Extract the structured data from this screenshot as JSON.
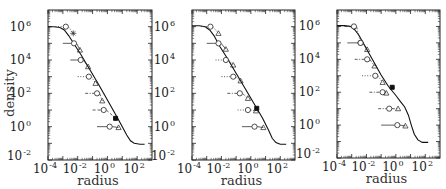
{
  "chart_data": [
    {
      "type": "line",
      "title": "",
      "xlabel": "radius",
      "ylabel": "density",
      "xscale": "log",
      "yscale": "log",
      "xlim": [
        0.0001,
        1000
      ],
      "ylim": [
        0.01,
        10000000
      ],
      "xticks": [
        {
          "base": "10",
          "exp": "-4",
          "value": -4
        },
        {
          "base": "10",
          "exp": "-2",
          "value": -2
        },
        {
          "base": "10",
          "exp": "0",
          "value": 0
        },
        {
          "base": "10",
          "exp": "2",
          "value": 2
        }
      ],
      "yticks": [
        {
          "base": "10",
          "exp": "-2",
          "value": -2
        },
        {
          "base": "10",
          "exp": "0",
          "value": 0
        },
        {
          "base": "10",
          "exp": "2",
          "value": 2
        },
        {
          "base": "10",
          "exp": "4",
          "value": 4
        },
        {
          "base": "10",
          "exp": "6",
          "value": 6
        }
      ],
      "show_ylabel": true,
      "profile_log": [
        [
          -4.0,
          6.0
        ],
        [
          -3.6,
          6.0
        ],
        [
          -3.2,
          5.95
        ],
        [
          -2.9,
          5.8
        ],
        [
          -2.6,
          5.45
        ],
        [
          -2.2,
          4.9
        ],
        [
          -1.8,
          4.35
        ],
        [
          -1.2,
          3.45
        ],
        [
          -0.6,
          2.55
        ],
        [
          0.0,
          1.6
        ],
        [
          0.6,
          0.65
        ],
        [
          1.0,
          0.0
        ],
        [
          1.3,
          -0.5
        ],
        [
          1.55,
          -0.85
        ],
        [
          1.8,
          -1.0
        ],
        [
          2.2,
          -1.05
        ],
        [
          2.5,
          -1.05
        ]
      ],
      "series": [
        {
          "name": "level 1",
          "style": "dotted",
          "line_from": -3.5,
          "circle": [
            -2.8,
            6.0
          ],
          "marker2": {
            "shape": "star",
            "at": [
              -2.3,
              5.6
            ]
          }
        },
        {
          "name": "level 2",
          "style": "solid",
          "line_from": -3.0,
          "circle": [
            -2.25,
            5.0
          ],
          "marker2": {
            "shape": "triangle",
            "at": [
              -1.85,
              4.6
            ]
          }
        },
        {
          "name": "level 3",
          "style": "solid",
          "line_from": -2.5,
          "circle": [
            -1.8,
            4.0
          ],
          "marker2": {
            "shape": "triangle",
            "at": [
              -1.3,
              3.6
            ]
          }
        },
        {
          "name": "level 4",
          "style": "dotted",
          "line_from": -2.0,
          "circle": [
            -1.25,
            3.0
          ],
          "marker2": {
            "shape": "triangle",
            "at": [
              -0.8,
              2.6
            ]
          }
        },
        {
          "name": "level 5",
          "style": "dashdot",
          "line_from": -1.5,
          "circle": [
            -0.7,
            2.0
          ],
          "marker2": {
            "shape": "triangle",
            "at": [
              -0.35,
              1.55
            ]
          }
        },
        {
          "name": "level 6",
          "style": "dashed",
          "line_from": -1.0,
          "circle": [
            -0.25,
            1.0
          ],
          "marker2": {
            "shape": "filled",
            "at": [
              0.55,
              0.5
            ]
          }
        },
        {
          "name": "level 7",
          "style": "solid",
          "line_from": -0.7,
          "circle": [
            0.15,
            0.0
          ],
          "marker2": {
            "shape": "triangle",
            "at": [
              0.75,
              -0.05
            ]
          }
        }
      ]
    },
    {
      "type": "line",
      "title": "",
      "xlabel": "radius",
      "ylabel": "",
      "xscale": "log",
      "yscale": "log",
      "xlim": [
        0.0001,
        1000
      ],
      "ylim": [
        0.01,
        10000000
      ],
      "xticks": [
        {
          "base": "10",
          "exp": "-4",
          "value": -4
        },
        {
          "base": "10",
          "exp": "-2",
          "value": -2
        },
        {
          "base": "10",
          "exp": "0",
          "value": 0
        },
        {
          "base": "10",
          "exp": "2",
          "value": 2
        }
      ],
      "yticks": [
        {
          "base": "10",
          "exp": "-2",
          "value": -2
        },
        {
          "base": "10",
          "exp": "0",
          "value": 0
        },
        {
          "base": "10",
          "exp": "2",
          "value": 2
        },
        {
          "base": "10",
          "exp": "4",
          "value": 4
        },
        {
          "base": "10",
          "exp": "6",
          "value": 6
        }
      ],
      "show_ylabel": false,
      "profile_log": [
        [
          -4.0,
          6.05
        ],
        [
          -3.5,
          6.05
        ],
        [
          -3.1,
          6.0
        ],
        [
          -2.8,
          5.8
        ],
        [
          -2.5,
          5.45
        ],
        [
          -2.1,
          4.8
        ],
        [
          -1.6,
          4.1
        ],
        [
          -1.0,
          3.2
        ],
        [
          -0.4,
          2.3
        ],
        [
          0.2,
          1.4
        ],
        [
          0.8,
          0.5
        ],
        [
          1.2,
          -0.2
        ],
        [
          1.45,
          -0.7
        ],
        [
          1.7,
          -0.95
        ],
        [
          2.0,
          -1.05
        ],
        [
          2.4,
          -1.05
        ]
      ],
      "series": [
        {
          "name": "level 1",
          "style": "dotted",
          "line_from": -3.4,
          "circle": [
            -2.75,
            6.0
          ],
          "marker2": {
            "shape": "triangle",
            "at": [
              -2.2,
              5.6
            ]
          }
        },
        {
          "name": "level 2",
          "style": "solid",
          "line_from": -3.0,
          "circle": [
            -2.2,
            5.0
          ],
          "marker2": {
            "shape": "triangle",
            "at": [
              -1.7,
              4.65
            ]
          }
        },
        {
          "name": "level 3",
          "style": "dotted",
          "line_from": -2.4,
          "circle": [
            -1.7,
            4.0
          ],
          "marker2": {
            "shape": "triangle",
            "at": [
              -1.2,
              3.7
            ]
          }
        },
        {
          "name": "level 4",
          "style": "dotted",
          "line_from": -2.0,
          "circle": [
            -1.2,
            3.0
          ],
          "marker2": {
            "shape": "triangle",
            "at": [
              -0.7,
              2.75
            ]
          }
        },
        {
          "name": "level 5",
          "style": "dashdot",
          "line_from": -1.6,
          "circle": [
            -0.75,
            2.0
          ],
          "marker2": {
            "shape": "triangle",
            "at": [
              -0.2,
              1.7
            ]
          }
        },
        {
          "name": "level 6",
          "style": "dotted",
          "line_from": -0.9,
          "circle": [
            -0.2,
            1.0
          ],
          "marker2": {
            "shape": "triangle",
            "at": [
              0.35,
              0.95
            ]
          }
        },
        {
          "name": "level 7",
          "style": "solid",
          "line_from": -0.6,
          "circle": [
            0.25,
            0.0
          ],
          "marker2": {
            "shape": "triangle",
            "at": [
              0.85,
              -0.05
            ]
          }
        }
      ],
      "extra_markers": [
        {
          "shape": "filled",
          "at": [
            0.4,
            1.1
          ]
        }
      ]
    },
    {
      "type": "line",
      "title": "",
      "xlabel": "radius",
      "ylabel": "",
      "xscale": "log",
      "yscale": "log",
      "xlim": [
        0.0001,
        1000
      ],
      "ylim": [
        0.01,
        10000000
      ],
      "xticks": [
        {
          "base": "10",
          "exp": "-4",
          "value": -4
        },
        {
          "base": "10",
          "exp": "-2",
          "value": -2
        },
        {
          "base": "10",
          "exp": "0",
          "value": 0
        },
        {
          "base": "10",
          "exp": "2",
          "value": 2
        }
      ],
      "yticks": [
        {
          "base": "10",
          "exp": "-2",
          "value": -2
        },
        {
          "base": "10",
          "exp": "0",
          "value": 0
        },
        {
          "base": "10",
          "exp": "2",
          "value": 2
        },
        {
          "base": "10",
          "exp": "4",
          "value": 4
        },
        {
          "base": "10",
          "exp": "6",
          "value": 6
        }
      ],
      "show_ylabel": false,
      "profile_log": [
        [
          -4.0,
          6.05
        ],
        [
          -3.5,
          6.05
        ],
        [
          -3.1,
          6.0
        ],
        [
          -2.8,
          5.8
        ],
        [
          -2.5,
          5.45
        ],
        [
          -2.1,
          4.8
        ],
        [
          -1.6,
          4.0
        ],
        [
          -1.0,
          3.05
        ],
        [
          -0.5,
          2.35
        ],
        [
          0.0,
          1.8
        ],
        [
          0.3,
          1.45
        ],
        [
          0.6,
          1.1
        ],
        [
          0.85,
          0.6
        ],
        [
          1.05,
          0.0
        ],
        [
          1.25,
          -0.55
        ],
        [
          1.5,
          -0.9
        ],
        [
          1.8,
          -1.05
        ],
        [
          2.2,
          -1.05
        ]
      ],
      "series": [
        {
          "name": "level 1",
          "style": "dashdot",
          "line_from": -3.5,
          "circle": [
            -2.85,
            6.0
          ],
          "marker2": {
            "shape": "circle",
            "at": [
              -2.4,
              5.0
            ]
          }
        },
        {
          "name": "level 2",
          "style": "solid",
          "line_from": -3.3,
          "circle": [
            -2.4,
            5.0
          ],
          "marker2": {
            "shape": "triangle",
            "at": [
              -1.95,
              4.6
            ]
          }
        },
        {
          "name": "level 3",
          "style": "dashdot",
          "line_from": -2.8,
          "circle": [
            -1.95,
            4.0
          ],
          "marker2": {
            "shape": "triangle",
            "at": [
              -1.45,
              3.6
            ]
          }
        },
        {
          "name": "level 4",
          "style": "dotted",
          "line_from": -2.3,
          "circle": [
            -1.4,
            3.0
          ],
          "marker2": {
            "shape": "triangle",
            "at": [
              -0.9,
              2.6
            ]
          }
        },
        {
          "name": "level 5",
          "style": "dashdot",
          "line_from": -1.8,
          "circle": [
            -0.9,
            2.0
          ],
          "marker2": {
            "shape": "triangle",
            "at": [
              -0.65,
              1.95
            ]
          }
        },
        {
          "name": "level 6",
          "style": "dashdot",
          "line_from": -1.2,
          "circle": [
            -0.45,
            1.0
          ],
          "marker2": {
            "shape": "triangle",
            "at": [
              0.15,
              1.0
            ]
          }
        },
        {
          "name": "level 7",
          "style": "solid",
          "line_from": -1.0,
          "circle": [
            0.1,
            0.0
          ],
          "marker2": {
            "shape": "triangle",
            "at": [
              0.65,
              -0.05
            ]
          }
        }
      ],
      "extra_markers": [
        {
          "shape": "filled",
          "at": [
            -0.25,
            2.3
          ]
        }
      ]
    }
  ]
}
